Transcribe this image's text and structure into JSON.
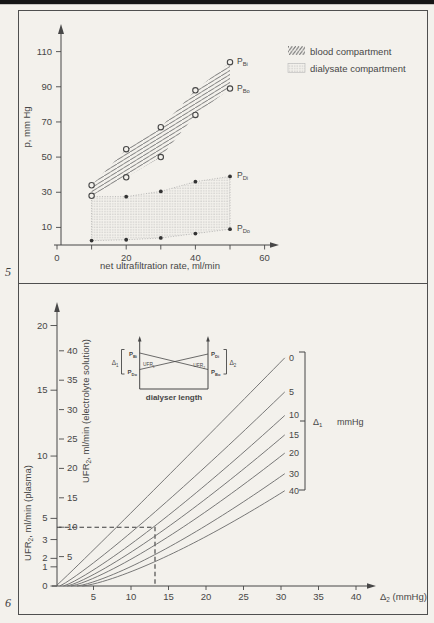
{
  "page": {
    "fig5_label": "5",
    "fig6_label": "6"
  },
  "colors": {
    "paper": "#f3f1ec",
    "ink": "#474747",
    "line": "#6a6a6a",
    "hatch": "#6f6f6f",
    "stipple": "#a6a6a6",
    "frame": "#4f4f4f",
    "topbar": "#161616"
  },
  "chart_data": [
    {
      "id": "fig5",
      "type": "scatter",
      "xlabel": "net ultrafiltration rate, ml/min",
      "ylabel": "p, mm Hg",
      "xlim": [
        0,
        65
      ],
      "ylim": [
        0,
        120
      ],
      "x_ticks": [
        0,
        10,
        20,
        30,
        40,
        50,
        60
      ],
      "x_labeled_ticks": [
        0,
        20,
        40,
        60
      ],
      "y_ticks": [
        10,
        30,
        50,
        70,
        90,
        110
      ],
      "legend": [
        {
          "pattern": "hatch",
          "label": "blood compartment"
        },
        {
          "pattern": "stipple",
          "label": "dialysate compartment"
        }
      ],
      "series": [
        {
          "name": "P_Bi",
          "label": {
            "main": "P",
            "sub": "Bi"
          },
          "marker": "open",
          "x": [
            10,
            20,
            30,
            40,
            50
          ],
          "y": [
            34,
            54.5,
            67,
            88,
            104
          ]
        },
        {
          "name": "P_Bo",
          "label": {
            "main": "P",
            "sub": "Bo"
          },
          "marker": "open",
          "x": [
            10,
            20,
            30,
            40,
            50
          ],
          "y": [
            28,
            38.5,
            50,
            74,
            89
          ]
        },
        {
          "name": "P_Di",
          "label": {
            "main": "P",
            "sub": "Di"
          },
          "marker": "filled",
          "x": [
            20,
            30,
            40,
            50
          ],
          "y": [
            27.5,
            30.5,
            36,
            39
          ]
        },
        {
          "name": "P_Do",
          "label": {
            "main": "P",
            "sub": "Do"
          },
          "marker": "filled",
          "x": [
            10,
            20,
            30,
            40,
            50
          ],
          "y": [
            2.5,
            3,
            4,
            6.5,
            9
          ]
        }
      ],
      "bands": [
        {
          "name": "blood-band",
          "pattern": "hatch",
          "top": [
            [
              10,
              34
            ],
            [
              20,
              54.5
            ],
            [
              30,
              67
            ],
            [
              40,
              88
            ],
            [
              50,
              104
            ]
          ],
          "bottom": [
            [
              10,
              28
            ],
            [
              20,
              38.5
            ],
            [
              30,
              50
            ],
            [
              40,
              74
            ],
            [
              50,
              89
            ]
          ]
        },
        {
          "name": "dialysate-band",
          "pattern": "stipple",
          "top": [
            [
              10,
              27.5
            ],
            [
              20,
              27.5
            ],
            [
              30,
              30.5
            ],
            [
              40,
              36
            ],
            [
              50,
              39
            ]
          ],
          "bottom": [
            [
              10,
              2.5
            ],
            [
              20,
              3
            ],
            [
              30,
              4
            ],
            [
              40,
              6.5
            ],
            [
              50,
              9
            ]
          ]
        }
      ]
    },
    {
      "id": "fig6",
      "type": "line",
      "xlabel_parts": [
        {
          "t": "Δ"
        },
        {
          "sub": "2"
        },
        {
          "t": " (mmHg)"
        }
      ],
      "ylabel_left_parts": [
        {
          "t": "UFR"
        },
        {
          "sub": "2"
        },
        {
          "t": ", ml/min (plasma)"
        }
      ],
      "ylabel_inner_parts": [
        {
          "t": "UFR"
        },
        {
          "sub": "2"
        },
        {
          "t": ", ml/min (electrolyte solution)"
        }
      ],
      "xlim": [
        0,
        43
      ],
      "x_ticks": [
        5,
        10,
        15,
        20,
        25,
        30,
        35,
        40
      ],
      "inner_y_ticks": [
        5,
        10,
        15,
        20,
        25,
        30,
        35,
        40
      ],
      "plasma_ticks": [
        {
          "label": "0",
          "pos": 0
        },
        {
          "label": "1",
          "pos": 3.26
        },
        {
          "label": "2",
          "pos": 4.7
        },
        {
          "label": "3",
          "pos": 7.9
        },
        {
          "label": "5",
          "pos": 11.5
        },
        {
          "label": "10",
          "pos": 22.1
        },
        {
          "label": "15",
          "pos": 33.3
        },
        {
          "label": "20",
          "pos": 44.3
        }
      ],
      "end_x": 30.5,
      "lines": [
        {
          "delta1": "0",
          "start_x": 0,
          "end_y": 38.8,
          "exp": 1.02
        },
        {
          "delta1": "5",
          "start_x": 0.5,
          "end_y": 33.0,
          "exp": 1.12
        },
        {
          "delta1": "10",
          "start_x": 1.0,
          "end_y": 29.0,
          "exp": 1.18
        },
        {
          "delta1": "15",
          "start_x": 1.5,
          "end_y": 25.7,
          "exp": 1.22
        },
        {
          "delta1": "20",
          "start_x": 2.0,
          "end_y": 22.6,
          "exp": 1.26
        },
        {
          "delta1": "30",
          "start_x": 2.8,
          "end_y": 19.1,
          "exp": 1.3
        },
        {
          "delta1": "40",
          "start_x": 3.5,
          "end_y": 16.2,
          "exp": 1.33
        }
      ],
      "bracket_delta_parts": [
        {
          "t": "Δ"
        },
        {
          "sub": "1"
        }
      ],
      "bracket_unit": "mmHg",
      "dashed_guide": {
        "y_electrolyte": 10,
        "x": 13.2
      },
      "inset": {
        "caption": "dialyser length",
        "labels": {
          "pbi": {
            "main": "P",
            "sub": "Bi"
          },
          "pdo": {
            "main": "P",
            "sub": "Do"
          },
          "pdi": {
            "main": "P",
            "sub": "Di"
          },
          "pbo": {
            "main": "P",
            "sub": "Bo"
          },
          "ufr1": {
            "main": "UFR",
            "sub": "1"
          },
          "ufr2": {
            "main": "UFR",
            "sub": "2"
          },
          "d1": {
            "main": "Δ",
            "sub": "1"
          },
          "d2": {
            "main": "Δ",
            "sub": "2"
          }
        }
      }
    }
  ]
}
